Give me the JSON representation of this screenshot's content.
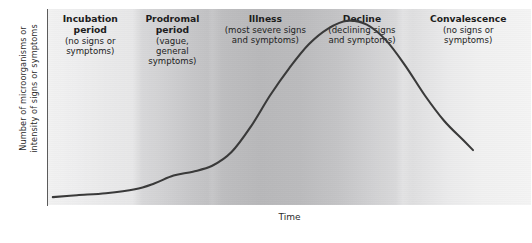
{
  "chart_data": {
    "type": "line",
    "title": "",
    "xlabel": "Time",
    "ylabel": "Number of microorganisms or\nintensity of signs or symptoms",
    "xlim": [
      0,
      100
    ],
    "ylim": [
      0,
      100
    ],
    "grid": false,
    "legend": "none",
    "axis_ticks": {
      "x": [],
      "y": []
    },
    "series": [
      {
        "name": "Number of microorganisms or intensity of signs or symptoms",
        "color": "#3a3a3a",
        "x": [
          1,
          6,
          12,
          18,
          22,
          26,
          30,
          34,
          38,
          42,
          46,
          50,
          54,
          58,
          62,
          66,
          70,
          74,
          78,
          82,
          86,
          88
        ],
        "y": [
          4,
          5,
          6,
          8,
          11,
          15,
          17,
          20,
          27,
          40,
          56,
          70,
          82,
          90,
          94,
          92,
          84,
          71,
          56,
          43,
          33,
          28
        ]
      }
    ],
    "stages": [
      {
        "name": "Incubation\nperiod",
        "description": "(no signs or\nsymptoms)",
        "x_start": 0,
        "x_end": 17.5
      },
      {
        "name": "Prodromal\nperiod",
        "description": "(vague,\ngeneral\nsymptoms)",
        "x_start": 17.5,
        "x_end": 34
      },
      {
        "name": "Illness",
        "description": "(most severe signs\nand symptoms)",
        "x_start": 34,
        "x_end": 56
      },
      {
        "name": "Decline",
        "description": "(declining signs\nand symptoms)",
        "x_start": 56,
        "x_end": 74
      },
      {
        "name": "Convalescence",
        "description": "(no signs or\nsymptoms)",
        "x_start": 74,
        "x_end": 100
      }
    ]
  },
  "axes": {
    "y_title": "Number of microorganisms or\nintensity of signs or symptoms",
    "x_title": "Time"
  },
  "colors": {
    "curve": "#3a3a3a",
    "axis": "#5c5c5c",
    "text": "#1d1d1d",
    "background_light": "#f2f2f2",
    "background_dark": "#b8b8ba"
  }
}
